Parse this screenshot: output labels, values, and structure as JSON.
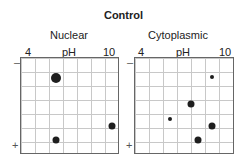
{
  "title": "Control",
  "panels": [
    {
      "name": "Nuclear",
      "ticks": {
        "left": "4",
        "mid": "pH",
        "right": "10"
      },
      "signs": {
        "top": "–",
        "bottom": "+"
      },
      "spots": [
        {
          "x": 35,
          "y": 20,
          "d": 10
        },
        {
          "x": 91,
          "y": 68,
          "d": 7
        },
        {
          "x": 35,
          "y": 82,
          "d": 7
        }
      ]
    },
    {
      "name": "Cytoplasmic",
      "ticks": {
        "left": "4",
        "mid": "pH",
        "right": "10"
      },
      "signs": {
        "top": "–",
        "bottom": "+"
      },
      "spots": [
        {
          "x": 77,
          "y": 19,
          "d": 4
        },
        {
          "x": 56,
          "y": 46,
          "d": 7
        },
        {
          "x": 35,
          "y": 61,
          "d": 4
        },
        {
          "x": 77,
          "y": 68,
          "d": 7
        },
        {
          "x": 63,
          "y": 82,
          "d": 7
        }
      ]
    }
  ]
}
